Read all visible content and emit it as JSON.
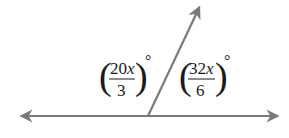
{
  "diagram": {
    "line_color": "#7a7a7a",
    "text_color": "#1a1a1a",
    "left_angle": {
      "numerator": "20",
      "variable": "x",
      "denominator": "3",
      "unit": "°"
    },
    "right_angle": {
      "numerator": "32",
      "variable": "x",
      "denominator": "6",
      "unit": "°"
    }
  }
}
